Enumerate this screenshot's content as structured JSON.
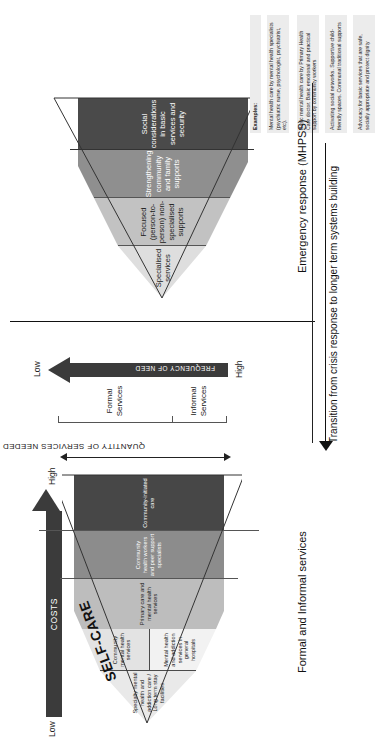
{
  "top_pyramid": {
    "self_care_label": "SELF-CARE",
    "costs_arrow": {
      "label": "COSTS",
      "low_end": "Low",
      "high_end": "High"
    },
    "frequency_arrow": {
      "label": "FREQUENCY OF NEED",
      "low_end": "Low",
      "high_end": "High"
    },
    "quantity_axis_label": "QUANTITY OF SERVICES NEEDED",
    "service_groups": [
      {
        "label": "Formal\nServices"
      },
      {
        "label": "Informal\nServices"
      }
    ],
    "tiers": [
      {
        "label": "Specialty mental health and addiction care / Long term stay facilities",
        "lines": [
          "Specialty",
          "mental",
          "health and",
          "addiction care / Long",
          "term stay facilities"
        ],
        "color": "#e9e9e9"
      },
      {
        "label": "Community mental health services",
        "lines": [
          "Community",
          "mental",
          "health",
          "services"
        ],
        "color": "#e3e3e3"
      },
      {
        "label": "Mental health and addiction services in general hospitals",
        "lines": [
          "Mental",
          "health and",
          "addiction services",
          "in general",
          "hospitals"
        ],
        "color": "#f2f2f2"
      },
      {
        "label": "Primary care and mental health services",
        "lines": [
          "Primary care and mental health services"
        ],
        "color": "#bdbdbd"
      },
      {
        "label": "Community health workers and peer support specialists",
        "lines": [
          "Community health workers and peer support specialists"
        ],
        "color": "#8c8c8c"
      },
      {
        "label": "Community-initiated care",
        "lines": [
          "Community-initiated care"
        ],
        "color": "#474747"
      }
    ]
  },
  "bottom_pyramid": {
    "block_label": "Emergency response (MHPSS)",
    "examples_heading": "Examples:",
    "tiers": [
      {
        "label": "Specialised services",
        "lines": [
          "Specialised",
          "services"
        ],
        "color": "#dedede",
        "example": "Mental health care by mental health specialists (psychiatric nurse, psychologist, psychiatrist, etc)."
      },
      {
        "label": "Focused (person-to-person) non-specialised supports",
        "lines": [
          "Focused",
          "(person-to-person)",
          "non-specialised supports"
        ],
        "color": "#c2c2c2",
        "example": "Basic mental health care by Primary Health Care doctor. Basic emotional and practical support by community workers"
      },
      {
        "label": "Strengthening community and family supports",
        "lines": [
          "Strengthening community and family",
          "supports"
        ],
        "color": "#8f8f8f",
        "example": "Activating social networks. Supportive child-friendly spaces. Communal traditional supports"
      },
      {
        "label": "Social considerations in basic services and security",
        "lines": [
          "Social considerations in basic services",
          "and security"
        ],
        "color": "#4a4a4a",
        "example": "Advocacy for basic services that are safe, socially appropriate and protect dignity"
      }
    ]
  },
  "cross_axis": {
    "formal_informal_label": "Formal and Informal services",
    "transition_label": "Transition from crisis response to longer term systems building"
  },
  "colors": {
    "ink": "#1a1a1a",
    "bar": "#3b3b3b",
    "rule": "#111111",
    "example_bg": "#ececec"
  }
}
